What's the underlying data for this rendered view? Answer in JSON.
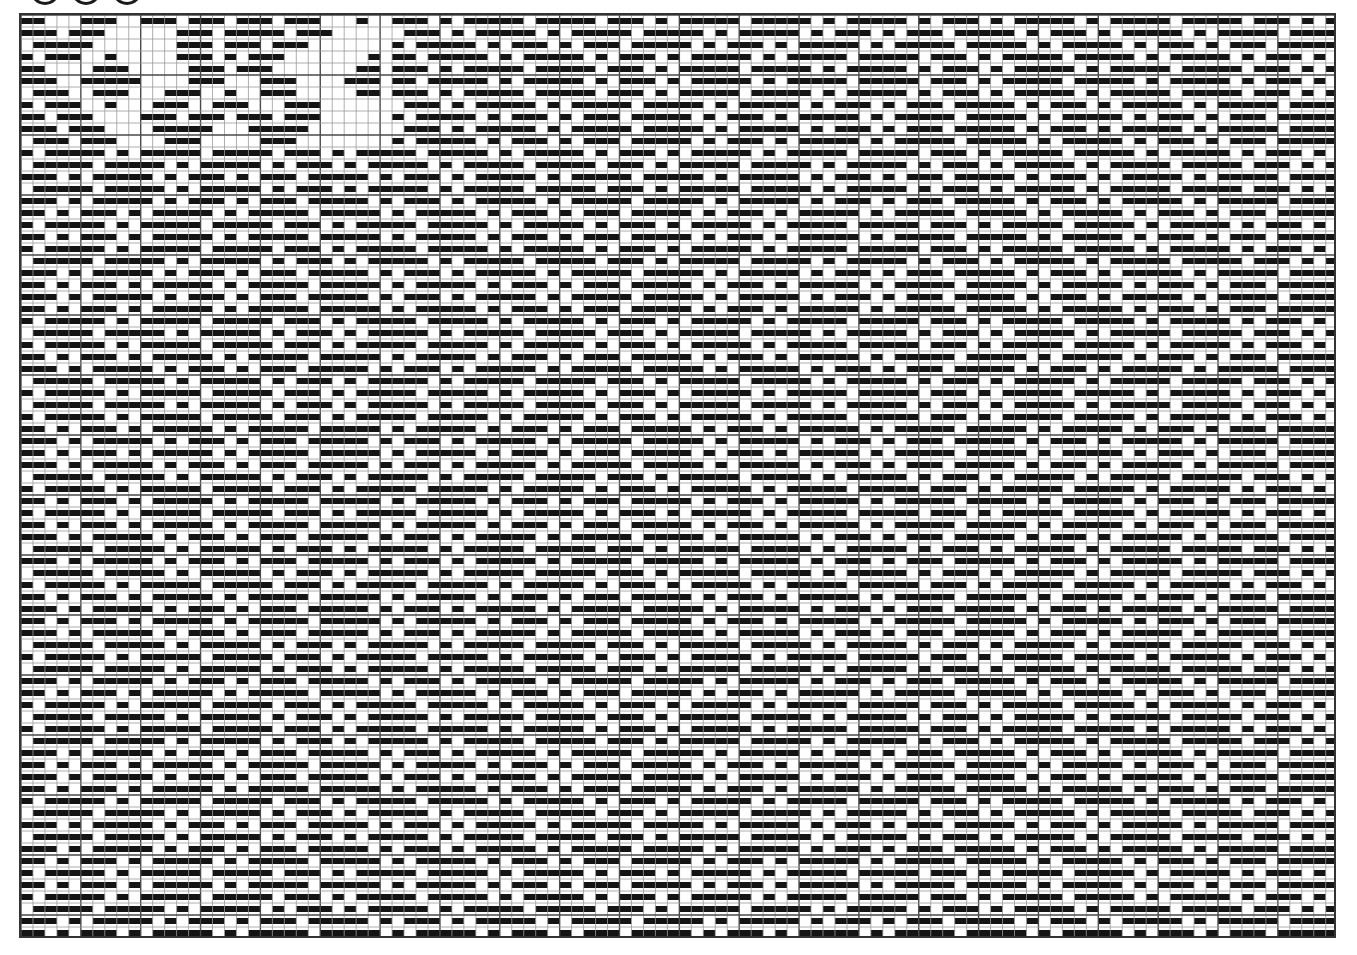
{
  "header": {
    "controls": [
      {
        "name": "circle-1",
        "cx": 45
      },
      {
        "name": "circle-2",
        "cx": 86
      },
      {
        "name": "circle-3",
        "cx": 127
      }
    ],
    "circle_bottom_y": 5
  },
  "draft": {
    "title": "Weave drawdown (3/1 twill diamond)",
    "columns": 110,
    "rows": 77,
    "cell_width": 11.97,
    "cell_height": 12.0,
    "bar_inset": 3,
    "bold_line_every": 5,
    "colors": {
      "bar": "#141414",
      "grid_thin": "#9a9a9a",
      "grid_bold": "#4a4a4a",
      "background": "#ffffff",
      "border": "#333333"
    },
    "known_rows": [
      "1100011100111011101110111000100",
      "1110111000000111011111011100000",
      "0111110000000111011101110000000",
      "1011100100000111010111000000010",
      "1100001110000011101110000000110",
      "1110011111000011100011100001110",
      "0111001110001110010011100000110",
      "1011100100011100111000111000000",
      "1101110000111011101110111000000",
      "1110111000011111000111110000000",
      "0111011100001110000011100000000"
    ],
    "twill": {
      "period": 4,
      "threading_repeat": 27,
      "treadling_repeat": 27,
      "threading_phase": 5,
      "treadling_phase": 0,
      "sub_point": 9
    }
  }
}
